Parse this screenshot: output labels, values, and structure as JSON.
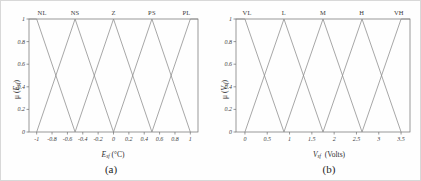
{
  "figure": {
    "background": "#ffffff",
    "axis_color": "#6e6e6e",
    "line_color": "#8a8a8a",
    "text_color": "#2a2a2a"
  },
  "panels": [
    {
      "id": "a",
      "subcaption": "(a)",
      "chart_data": {
        "type": "line",
        "title": "",
        "xlabel": "Esf (°C)",
        "xlabel_var": "E",
        "xlabel_sub": "sf",
        "xlabel_unit": "(°C)",
        "ylabel": "μ (Esf)",
        "ylabel_mu": "μ (",
        "ylabel_var": "E",
        "ylabel_sub": "sf",
        "ylabel_close": ")",
        "xlim": [
          -1.1,
          1.1
        ],
        "ylim": [
          0,
          1
        ],
        "grid": false,
        "legend": "inside-top",
        "xticks": [
          -1,
          -0.8,
          -0.6,
          -0.4,
          -0.2,
          0,
          0.2,
          0.4,
          0.6,
          0.8,
          1
        ],
        "xtick_labels": [
          "-1",
          "-0.8",
          "-0.6",
          "-0.4",
          "-0.2",
          "0",
          "0.2",
          "0.4",
          "0.6",
          "0.8",
          "1"
        ],
        "yticks": [
          0,
          0.2,
          0.4,
          0.6,
          0.8,
          1
        ],
        "ytick_labels": [
          "0",
          "0.2",
          "0.4",
          "0.6",
          "0.8",
          "1"
        ],
        "series": [
          {
            "name": "NL",
            "label_x": -0.93,
            "points": [
              [
                -1.1,
                1
              ],
              [
                -1.0,
                1
              ],
              [
                -0.5,
                0
              ]
            ]
          },
          {
            "name": "NS",
            "label_x": -0.5,
            "points": [
              [
                -1.0,
                0
              ],
              [
                -0.5,
                1
              ],
              [
                0.0,
                0
              ]
            ]
          },
          {
            "name": "Z",
            "label_x": 0.0,
            "points": [
              [
                -0.5,
                0
              ],
              [
                0.0,
                1
              ],
              [
                0.5,
                0
              ]
            ]
          },
          {
            "name": "PS",
            "label_x": 0.5,
            "points": [
              [
                0.0,
                0
              ],
              [
                0.5,
                1
              ],
              [
                1.0,
                0
              ]
            ]
          },
          {
            "name": "PL",
            "label_x": 0.95,
            "points": [
              [
                0.5,
                0
              ],
              [
                1.0,
                1
              ],
              [
                1.1,
                1
              ]
            ]
          }
        ]
      }
    },
    {
      "id": "b",
      "subcaption": "(b)",
      "chart_data": {
        "type": "line",
        "title": "",
        "xlabel": "Vsf (Volts)",
        "xlabel_var": "V",
        "xlabel_sub": "sf",
        "xlabel_unit": "(Volts)",
        "ylabel": "μ (Vsf)",
        "ylabel_mu": "μ (",
        "ylabel_var": "V",
        "ylabel_sub": "sf",
        "ylabel_close": ")",
        "xlim": [
          -0.2,
          3.7
        ],
        "ylim": [
          0,
          1
        ],
        "grid": false,
        "legend": "inside-top",
        "xticks": [
          0,
          0.5,
          1,
          1.5,
          2,
          2.5,
          3,
          3.5
        ],
        "xtick_labels": [
          "0",
          "0.5",
          "1",
          "1.5",
          "2",
          "2.5",
          "3",
          "3.5"
        ],
        "yticks": [
          0,
          0.2,
          0.4,
          0.6,
          0.8,
          1
        ],
        "ytick_labels": [
          "0",
          "0.2",
          "0.4",
          "0.6",
          "0.8",
          "1"
        ],
        "series": [
          {
            "name": "VL",
            "label_x": 0.05,
            "points": [
              [
                -0.2,
                1
              ],
              [
                0.0,
                1
              ],
              [
                0.875,
                0
              ]
            ]
          },
          {
            "name": "L",
            "label_x": 0.87,
            "points": [
              [
                0.0,
                0
              ],
              [
                0.875,
                1
              ],
              [
                1.75,
                0
              ]
            ]
          },
          {
            "name": "M",
            "label_x": 1.75,
            "points": [
              [
                0.875,
                0
              ],
              [
                1.75,
                1
              ],
              [
                2.625,
                0
              ]
            ]
          },
          {
            "name": "H",
            "label_x": 2.62,
            "points": [
              [
                1.75,
                0
              ],
              [
                2.625,
                1
              ],
              [
                3.5,
                0
              ]
            ]
          },
          {
            "name": "VH",
            "label_x": 3.45,
            "points": [
              [
                2.625,
                0
              ],
              [
                3.5,
                1
              ],
              [
                3.7,
                1
              ]
            ]
          }
        ]
      }
    }
  ]
}
